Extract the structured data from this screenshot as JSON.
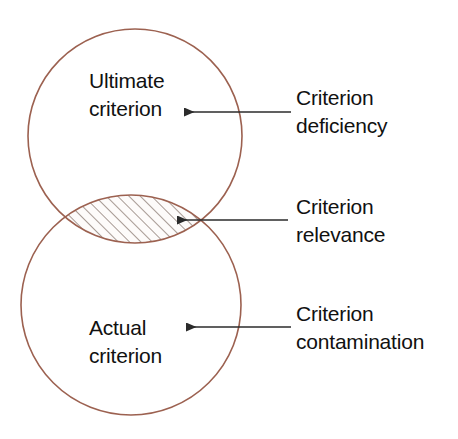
{
  "figure": {
    "kind": "venn-diagram",
    "background_color": "#ffffff",
    "circle_stroke_color": "#9c6150",
    "hatch_color": "#8a7a72",
    "hatch_fill_color": "#fdfbfa",
    "arrow_color": "#2b2b2b",
    "text_color": "#111111"
  },
  "circles": {
    "top": {
      "label_line1": "Ultimate",
      "label_line2": "criterion",
      "cx": 135,
      "cy": 136,
      "r": 107
    },
    "bottom": {
      "label_line1": "Actual",
      "label_line2": "criterion",
      "cx": 131,
      "cy": 305,
      "r": 110
    }
  },
  "overlap": {
    "name": "criterion-relevance-lens",
    "hatched": true,
    "hatch_angle_degrees": 45,
    "hatch_spacing_px": 8
  },
  "callouts": [
    {
      "id": "criterion-deficiency",
      "line1": "Criterion",
      "line2": "deficiency",
      "arrow_tip_x": 184,
      "arrow_tail_x": 291,
      "arrow_y": 112,
      "text_x": 296,
      "text_y": 105
    },
    {
      "id": "criterion-relevance",
      "line1": "Criterion",
      "line2": "relevance",
      "arrow_tip_x": 177,
      "arrow_tail_x": 288,
      "arrow_y": 220,
      "text_x": 296,
      "text_y": 214
    },
    {
      "id": "criterion-contamination",
      "line1": "Criterion",
      "line2": "contamination",
      "arrow_tip_x": 186,
      "arrow_tail_x": 291,
      "arrow_y": 327,
      "text_x": 296,
      "text_y": 321
    }
  ]
}
